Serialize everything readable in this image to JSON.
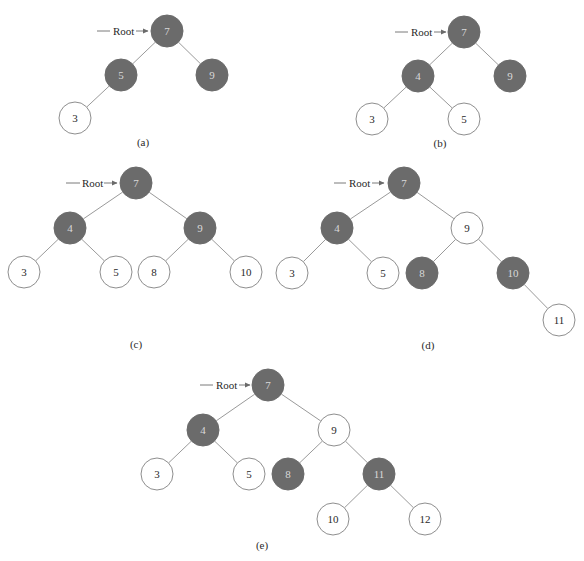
{
  "diagram": {
    "colors": {
      "black_node": "#6b6b6b",
      "red_node": "#ffffff",
      "edge": "#9a9a9a"
    },
    "root_label": "Root",
    "node_radius": 16,
    "trees": [
      {
        "caption": "(a)",
        "caption_pos": [
          143,
          146
        ],
        "root_pointer": {
          "line": [
            97,
            31,
            110,
            31
          ],
          "text_x": 113,
          "arrow": [
            136,
            31,
            148,
            31
          ],
          "y": 31
        },
        "nodes": [
          {
            "id": "7",
            "label": "7",
            "color": "black",
            "x": 167,
            "y": 31
          },
          {
            "id": "5",
            "label": "5",
            "color": "black",
            "x": 121,
            "y": 75
          },
          {
            "id": "9",
            "label": "9",
            "color": "black",
            "x": 212,
            "y": 75
          },
          {
            "id": "3",
            "label": "3",
            "color": "red",
            "x": 75,
            "y": 118
          }
        ],
        "edges": [
          [
            "7",
            "5"
          ],
          [
            "7",
            "9"
          ],
          [
            "5",
            "3"
          ]
        ]
      },
      {
        "caption": "(b)",
        "caption_pos": [
          440,
          147
        ],
        "root_pointer": {
          "line": [
            395,
            32,
            408,
            32
          ],
          "text_x": 411,
          "arrow": [
            434,
            32,
            446,
            32
          ],
          "y": 32
        },
        "nodes": [
          {
            "id": "7",
            "label": "7",
            "color": "black",
            "x": 464,
            "y": 32
          },
          {
            "id": "4",
            "label": "4",
            "color": "black",
            "x": 418,
            "y": 76
          },
          {
            "id": "9",
            "label": "9",
            "color": "black",
            "x": 510,
            "y": 76
          },
          {
            "id": "3",
            "label": "3",
            "color": "red",
            "x": 372,
            "y": 119
          },
          {
            "id": "5",
            "label": "5",
            "color": "red",
            "x": 464,
            "y": 119
          }
        ],
        "edges": [
          [
            "7",
            "4"
          ],
          [
            "7",
            "9"
          ],
          [
            "4",
            "3"
          ],
          [
            "4",
            "5"
          ]
        ]
      },
      {
        "caption": "(c)",
        "caption_pos": [
          136,
          348
        ],
        "root_pointer": {
          "line": [
            66,
            183,
            80,
            183
          ],
          "text_x": 82,
          "arrow": [
            104,
            183,
            117,
            183
          ],
          "y": 183
        },
        "nodes": [
          {
            "id": "7",
            "label": "7",
            "color": "black",
            "x": 136,
            "y": 183
          },
          {
            "id": "4",
            "label": "4",
            "color": "black",
            "x": 70,
            "y": 228
          },
          {
            "id": "9",
            "label": "9",
            "color": "black",
            "x": 200,
            "y": 228
          },
          {
            "id": "3",
            "label": "3",
            "color": "red",
            "x": 24,
            "y": 272
          },
          {
            "id": "5",
            "label": "5",
            "color": "red",
            "x": 116,
            "y": 272
          },
          {
            "id": "8",
            "label": "8",
            "color": "red",
            "x": 154,
            "y": 272
          },
          {
            "id": "10",
            "label": "10",
            "color": "red",
            "x": 246,
            "y": 272
          }
        ],
        "edges": [
          [
            "7",
            "4"
          ],
          [
            "7",
            "9"
          ],
          [
            "4",
            "3"
          ],
          [
            "4",
            "5"
          ],
          [
            "9",
            "8"
          ],
          [
            "9",
            "10"
          ]
        ]
      },
      {
        "caption": "(d)",
        "caption_pos": [
          428,
          349
        ],
        "root_pointer": {
          "line": [
            334,
            183,
            346,
            183
          ],
          "text_x": 349,
          "arrow": [
            372,
            183,
            384,
            183
          ],
          "y": 183
        },
        "nodes": [
          {
            "id": "7",
            "label": "7",
            "color": "black",
            "x": 404,
            "y": 183
          },
          {
            "id": "4",
            "label": "4",
            "color": "black",
            "x": 337,
            "y": 228
          },
          {
            "id": "9",
            "label": "9",
            "color": "red",
            "x": 467,
            "y": 228
          },
          {
            "id": "3",
            "label": "3",
            "color": "red",
            "x": 292,
            "y": 273
          },
          {
            "id": "5",
            "label": "5",
            "color": "red",
            "x": 383,
            "y": 273
          },
          {
            "id": "8",
            "label": "8",
            "color": "black",
            "x": 422,
            "y": 273
          },
          {
            "id": "10",
            "label": "10",
            "color": "black",
            "x": 513,
            "y": 273
          },
          {
            "id": "11",
            "label": "11",
            "color": "red",
            "x": 559,
            "y": 320
          }
        ],
        "edges": [
          [
            "7",
            "4"
          ],
          [
            "7",
            "9"
          ],
          [
            "4",
            "3"
          ],
          [
            "4",
            "5"
          ],
          [
            "9",
            "8"
          ],
          [
            "9",
            "10"
          ],
          [
            "10",
            "11"
          ]
        ]
      },
      {
        "caption": "(e)",
        "caption_pos": [
          262,
          549
        ],
        "root_pointer": {
          "line": [
            200,
            385,
            213,
            385
          ],
          "text_x": 216,
          "arrow": [
            239,
            385,
            250,
            385
          ],
          "y": 385
        },
        "nodes": [
          {
            "id": "7",
            "label": "7",
            "color": "black",
            "x": 268,
            "y": 385
          },
          {
            "id": "4",
            "label": "4",
            "color": "black",
            "x": 203,
            "y": 430
          },
          {
            "id": "9",
            "label": "9",
            "color": "red",
            "x": 334,
            "y": 430
          },
          {
            "id": "3",
            "label": "3",
            "color": "red",
            "x": 157,
            "y": 474
          },
          {
            "id": "5",
            "label": "5",
            "color": "red",
            "x": 249,
            "y": 474
          },
          {
            "id": "8",
            "label": "8",
            "color": "black",
            "x": 288,
            "y": 474
          },
          {
            "id": "11",
            "label": "11",
            "color": "black",
            "x": 379,
            "y": 474
          },
          {
            "id": "10",
            "label": "10",
            "color": "red",
            "x": 333,
            "y": 519
          },
          {
            "id": "12",
            "label": "12",
            "color": "red",
            "x": 425,
            "y": 519
          }
        ],
        "edges": [
          [
            "7",
            "4"
          ],
          [
            "7",
            "9"
          ],
          [
            "4",
            "3"
          ],
          [
            "4",
            "5"
          ],
          [
            "9",
            "8"
          ],
          [
            "9",
            "11"
          ],
          [
            "11",
            "10"
          ],
          [
            "11",
            "12"
          ]
        ]
      }
    ]
  }
}
